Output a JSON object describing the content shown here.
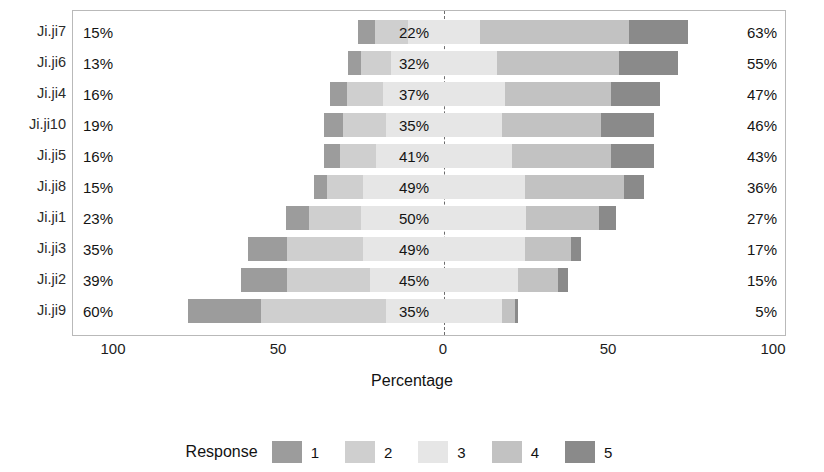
{
  "chart_data": {
    "type": "bar",
    "subtype": "diverging-stacked-likert",
    "title": "",
    "xlabel": "Percentage",
    "ylabel": "",
    "xlim": [
      -100,
      100
    ],
    "xticks": [
      -100,
      -50,
      0,
      50,
      100
    ],
    "xticklabels": [
      "100",
      "50",
      "0",
      "50",
      "100"
    ],
    "grid": false,
    "legend": {
      "title": "Response",
      "position": "bottom",
      "entries": [
        "1",
        "2",
        "3",
        "4",
        "5"
      ]
    },
    "colors": {
      "1": "#9c9c9c",
      "2": "#cfcfcf",
      "3": "#e6e6e6",
      "4": "#c2c2c2",
      "5": "#8a8a8a",
      "panel_border": "#b9b9b9",
      "zero_line": "#6d6d6d",
      "background": "#ffffff"
    },
    "categories": [
      "Ji.ji7",
      "Ji.ji6",
      "Ji.ji4",
      "Ji.ji10",
      "Ji.ji5",
      "Ji.ji8",
      "Ji.ji1",
      "Ji.ji3",
      "Ji.ji2",
      "Ji.ji9"
    ],
    "series": [
      {
        "name": "1",
        "values": [
          5,
          4,
          5,
          6,
          5,
          4,
          7,
          12,
          14,
          22
        ]
      },
      {
        "name": "2",
        "values": [
          10,
          9,
          11,
          13,
          11,
          11,
          16,
          23,
          25,
          38
        ]
      },
      {
        "name": "3",
        "values": [
          22,
          32,
          37,
          35,
          41,
          49,
          50,
          49,
          45,
          35
        ]
      },
      {
        "name": "4",
        "values": [
          45,
          37,
          32,
          30,
          30,
          30,
          22,
          14,
          12,
          4
        ]
      },
      {
        "name": "5",
        "values": [
          18,
          18,
          15,
          16,
          13,
          6,
          5,
          3,
          3,
          1
        ]
      }
    ],
    "rows": [
      {
        "label": "Ji.ji7",
        "left_pct": "15%",
        "mid_pct": "22%",
        "right_pct": "63%",
        "left_value": 15,
        "mid_value": 22,
        "right_value": 63,
        "segments": {
          "1": 5,
          "2": 10,
          "3": 22,
          "4": 45,
          "5": 18
        }
      },
      {
        "label": "Ji.ji6",
        "left_pct": "13%",
        "mid_pct": "32%",
        "right_pct": "55%",
        "left_value": 13,
        "mid_value": 32,
        "right_value": 55,
        "segments": {
          "1": 4,
          "2": 9,
          "3": 32,
          "4": 37,
          "5": 18
        }
      },
      {
        "label": "Ji.ji4",
        "left_pct": "16%",
        "mid_pct": "37%",
        "right_pct": "47%",
        "left_value": 16,
        "mid_value": 37,
        "right_value": 47,
        "segments": {
          "1": 5,
          "2": 11,
          "3": 37,
          "4": 32,
          "5": 15
        }
      },
      {
        "label": "Ji.ji10",
        "left_pct": "19%",
        "mid_pct": "35%",
        "right_pct": "46%",
        "left_value": 19,
        "mid_value": 35,
        "right_value": 46,
        "segments": {
          "1": 6,
          "2": 13,
          "3": 35,
          "4": 30,
          "5": 16
        }
      },
      {
        "label": "Ji.ji5",
        "left_pct": "16%",
        "mid_pct": "41%",
        "right_pct": "43%",
        "left_value": 16,
        "mid_value": 41,
        "right_value": 43,
        "segments": {
          "1": 5,
          "2": 11,
          "3": 41,
          "4": 30,
          "5": 13
        }
      },
      {
        "label": "Ji.ji8",
        "left_pct": "15%",
        "mid_pct": "49%",
        "right_pct": "36%",
        "left_value": 15,
        "mid_value": 49,
        "right_value": 36,
        "segments": {
          "1": 4,
          "2": 11,
          "3": 49,
          "4": 30,
          "5": 6
        }
      },
      {
        "label": "Ji.ji1",
        "left_pct": "23%",
        "mid_pct": "50%",
        "right_pct": "27%",
        "left_value": 23,
        "mid_value": 50,
        "right_value": 27,
        "segments": {
          "1": 7,
          "2": 16,
          "3": 50,
          "4": 22,
          "5": 5
        }
      },
      {
        "label": "Ji.ji3",
        "left_pct": "35%",
        "mid_pct": "49%",
        "right_pct": "17%",
        "left_value": 35,
        "mid_value": 49,
        "right_value": 17,
        "segments": {
          "1": 12,
          "2": 23,
          "3": 49,
          "4": 14,
          "5": 3
        }
      },
      {
        "label": "Ji.ji2",
        "left_pct": "39%",
        "mid_pct": "45%",
        "right_pct": "15%",
        "left_value": 39,
        "mid_value": 45,
        "right_value": 15,
        "segments": {
          "1": 14,
          "2": 25,
          "3": 45,
          "4": 12,
          "5": 3
        }
      },
      {
        "label": "Ji.ji9",
        "left_pct": "60%",
        "mid_pct": "35%",
        "right_pct": "5%",
        "left_value": 60,
        "mid_value": 35,
        "right_value": 5,
        "segments": {
          "1": 22,
          "2": 38,
          "3": 35,
          "4": 4,
          "5": 1
        }
      }
    ]
  }
}
